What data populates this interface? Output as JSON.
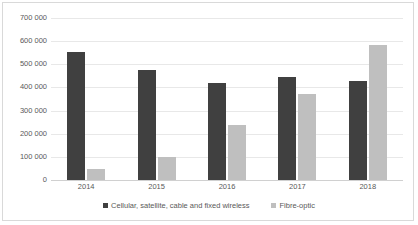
{
  "chart_data": {
    "type": "bar",
    "title": "",
    "subtitle": "",
    "xlabel": "",
    "ylabel": "",
    "categories": [
      "2014",
      "2015",
      "2016",
      "2017",
      "2018"
    ],
    "series": [
      {
        "name": "Cellular, satellite, cable and fixed wireless",
        "color": "#404040",
        "values": [
          551000,
          477000,
          420000,
          446000,
          430000
        ]
      },
      {
        "name": "Fibre-optic",
        "color": "#bfbfbf",
        "values": [
          48000,
          100000,
          236000,
          372000,
          583000
        ]
      }
    ],
    "ylim": [
      0,
      700000
    ],
    "ytick_step": 100000,
    "ytick_labels": [
      "0",
      "100 000",
      "200 000",
      "300 000",
      "400 000",
      "500 000",
      "600 000",
      "700 000"
    ],
    "ytick_values": [
      0,
      100000,
      200000,
      300000,
      400000,
      500000,
      600000,
      700000
    ],
    "grid": true,
    "grid_axis": "y",
    "legend_position": "bottom",
    "bar_mode": "grouped",
    "frame_color": "#d9d9d9",
    "gridline_color": "#e8e8e8",
    "tick_label_color": "#595959"
  }
}
